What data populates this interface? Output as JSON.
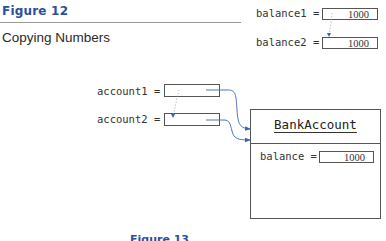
{
  "figure": {
    "label": "Figure 12",
    "caption": "Copying Numbers",
    "next_label": "Figure 13"
  },
  "numbers": {
    "balance1": {
      "label": "balance1 =",
      "value": "1000"
    },
    "balance2": {
      "label": "balance2 =",
      "value": "1000"
    }
  },
  "references": {
    "account1": {
      "label": "account1 ="
    },
    "account2": {
      "label": "account2 ="
    }
  },
  "object": {
    "class_name": "BankAccount",
    "field": {
      "label": "balance =",
      "value": "1000"
    }
  },
  "colors": {
    "accent": "#2b4f9e",
    "arrow": "#3a66b0",
    "border": "#555555"
  }
}
